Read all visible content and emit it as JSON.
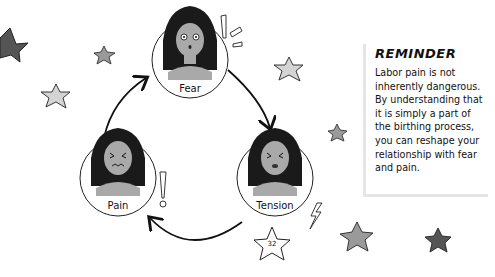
{
  "cycle": {
    "nodes": [
      {
        "label": "Fear",
        "expression": "scared"
      },
      {
        "label": "Tension",
        "expression": "clenched"
      },
      {
        "label": "Pain",
        "expression": "wincing"
      }
    ],
    "arrows": [
      "fear-to-tension",
      "tension-to-pain",
      "pain-to-fear"
    ]
  },
  "reminder": {
    "title": "REMINDER",
    "body": "Labor pain is not inherently dangerous. By understanding that it is simply a part of the birthing process, you can reshape your relationship with fear and pain."
  },
  "page_number": "32",
  "colors": {
    "hair": "#1a1a1a",
    "skin": "#a9a9a9",
    "star_dark": "#555555",
    "star_mid": "#9a9a9a",
    "star_light": "#d4d4d4",
    "panel_border": "#e5e5e5"
  }
}
